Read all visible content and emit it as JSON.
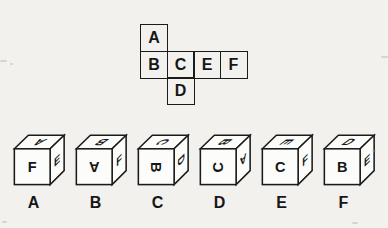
{
  "puzzle": {
    "net": {
      "cells": [
        {
          "letter": "A",
          "position": "row1-col1"
        },
        {
          "letter": "B",
          "position": "row2-col1"
        },
        {
          "letter": "C",
          "position": "row2-col2"
        },
        {
          "letter": "E",
          "position": "row2-col3"
        },
        {
          "letter": "F",
          "position": "row2-col4"
        },
        {
          "letter": "D",
          "position": "row3-col2"
        }
      ]
    },
    "options": [
      {
        "label": "A",
        "top": "A",
        "front": "F",
        "right": "E"
      },
      {
        "label": "B",
        "top": "B",
        "front": "A",
        "right": "F"
      },
      {
        "label": "C",
        "top": "C",
        "front": "B",
        "right": "D"
      },
      {
        "label": "D",
        "top": "B",
        "front": "C",
        "right": "A"
      },
      {
        "label": "E",
        "top": "E",
        "front": "C",
        "right": "F"
      },
      {
        "label": "F",
        "top": "D",
        "front": "B",
        "right": "E"
      }
    ],
    "colors": {
      "ink": "#161616",
      "background": "#f2f1ee",
      "cube_face": "#fcfcfa"
    }
  }
}
